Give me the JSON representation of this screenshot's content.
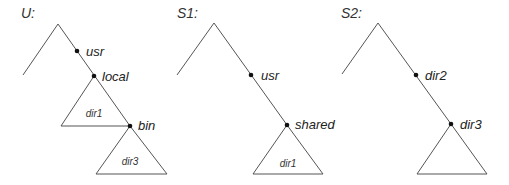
{
  "diagram": {
    "type": "directory-tree-comparison",
    "trees": [
      {
        "id": "U",
        "title": "U:",
        "nodes": [
          {
            "name": "usr",
            "label": "usr"
          },
          {
            "name": "local",
            "label": "local"
          },
          {
            "name": "bin",
            "label": "bin"
          }
        ],
        "subtrees": [
          {
            "attached_to": "local",
            "label": "dir1"
          },
          {
            "attached_to": "bin",
            "label": "dir3"
          }
        ]
      },
      {
        "id": "S1",
        "title": "S1:",
        "nodes": [
          {
            "name": "usr",
            "label": "usr"
          },
          {
            "name": "shared",
            "label": "shared"
          }
        ],
        "subtrees": [
          {
            "attached_to": "shared",
            "label": "dir1"
          }
        ]
      },
      {
        "id": "S2",
        "title": "S2:",
        "nodes": [
          {
            "name": "dir2",
            "label": "dir2"
          },
          {
            "name": "dir3",
            "label": "dir3"
          }
        ],
        "subtrees": [
          {
            "attached_to": "dir3",
            "label": ""
          }
        ]
      }
    ],
    "colors": {
      "edge": "#555555",
      "dot": "#111111",
      "text": "#222222"
    }
  }
}
